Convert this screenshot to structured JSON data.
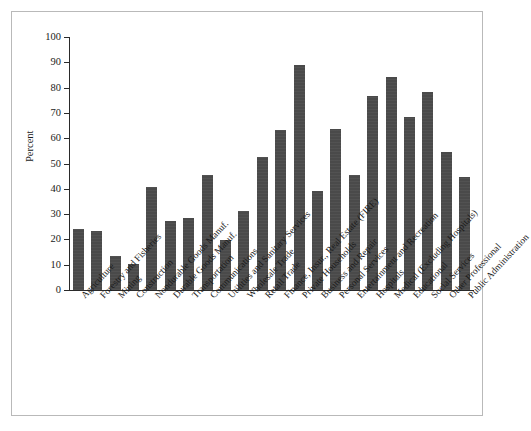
{
  "chart_data": {
    "type": "bar",
    "title": "",
    "xlabel": "",
    "ylabel": "Percent",
    "ylim": [
      0,
      100
    ],
    "ytick_labels": [
      "100",
      "90",
      "80",
      "70",
      "60",
      "50",
      "40",
      "30",
      "20",
      "10",
      "0"
    ],
    "yticks": [
      100,
      90,
      80,
      70,
      60,
      50,
      40,
      30,
      20,
      10,
      0
    ],
    "grid": false,
    "legend": null,
    "bar_color": "#4a4a4a",
    "axis_color": "#2a2a2a",
    "frame_color": "#b9b9b9",
    "categories": [
      "Agriculture",
      "Forestry and Fisheries",
      "Mining",
      "Construction",
      "Nondurable Goods Manuf.",
      "Durable Goods Manuf.",
      "Transportation",
      "Communications",
      "Utilities and Sanitary Services",
      "Wholesale Trade",
      "Retail Trade",
      "Finance, Insur., Real Estate (FIRE)",
      "Private Households",
      "Business and Repair",
      "Personal Services",
      "Entertainment and Recreation",
      "Hospitals",
      "Medical (Excluding Hospitals)",
      "Educational",
      "Social Services",
      "Other Professional",
      "Public Administration"
    ],
    "values": [
      24.3,
      23.5,
      13.5,
      10.2,
      40.7,
      27.3,
      28.5,
      45.3,
      19.6,
      31.3,
      52.5,
      63.3,
      88.8,
      39.2,
      63.5,
      45.5,
      76.5,
      84.3,
      68.5,
      78.3,
      54.5,
      44.5
    ]
  }
}
